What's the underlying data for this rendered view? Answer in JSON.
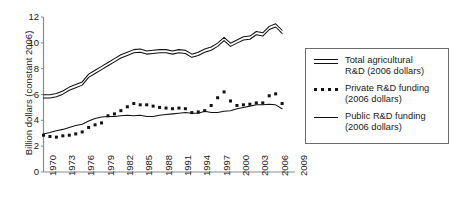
{
  "chart_data": {
    "type": "line",
    "title": "",
    "xlabel": "",
    "ylabel": "Billion dollars (constant 2006)",
    "xlim": [
      1970,
      2009
    ],
    "ylim": [
      0,
      12
    ],
    "yticks": [
      0,
      2,
      4,
      6,
      8,
      10,
      12
    ],
    "xticks": [
      "1970",
      "1973",
      "1976",
      "1979",
      "1982",
      "1985",
      "1988",
      "1991",
      "1994",
      "1997",
      "2000",
      "2003",
      "2006",
      "2009"
    ],
    "grid": false,
    "legend_position": "right",
    "x": [
      1970,
      1971,
      1972,
      1973,
      1974,
      1975,
      1976,
      1977,
      1978,
      1979,
      1980,
      1981,
      1982,
      1983,
      1984,
      1985,
      1986,
      1987,
      1988,
      1989,
      1990,
      1991,
      1992,
      1993,
      1994,
      1995,
      1996,
      1997,
      1998,
      1999,
      2000,
      2001,
      2002,
      2003,
      2004,
      2005,
      2006,
      2007
    ],
    "series": [
      {
        "name": "Total agricultural R&D (2006 dollars)",
        "style": "double-line",
        "values": [
          5.85,
          5.85,
          5.95,
          6.15,
          6.45,
          6.65,
          6.85,
          7.45,
          7.75,
          8.05,
          8.35,
          8.65,
          8.95,
          9.15,
          9.35,
          9.4,
          9.25,
          9.3,
          9.35,
          9.35,
          9.25,
          9.35,
          9.3,
          9.0,
          9.15,
          9.4,
          9.55,
          9.85,
          10.3,
          9.85,
          10.1,
          10.35,
          10.4,
          10.75,
          10.65,
          11.15,
          11.35,
          10.85
        ]
      },
      {
        "name": "Private R&D funding (2006 dollars)",
        "style": "dotted",
        "values": [
          2.85,
          2.75,
          2.7,
          2.8,
          2.85,
          2.95,
          3.1,
          3.45,
          3.65,
          3.8,
          4.35,
          4.5,
          4.75,
          5.05,
          5.3,
          5.2,
          5.2,
          5.1,
          5.0,
          4.95,
          4.9,
          4.95,
          4.9,
          4.6,
          4.65,
          4.75,
          5.15,
          5.75,
          6.2,
          5.5,
          5.15,
          5.2,
          5.25,
          5.35,
          5.35,
          5.9,
          6.05,
          5.3
        ]
      },
      {
        "name": "Public R&D funding (2006 dollars)",
        "style": "solid",
        "values": [
          2.95,
          3.05,
          3.2,
          3.3,
          3.45,
          3.6,
          3.7,
          3.95,
          4.15,
          4.25,
          4.3,
          4.3,
          4.35,
          4.4,
          4.35,
          4.4,
          4.3,
          4.3,
          4.4,
          4.45,
          4.5,
          4.55,
          4.6,
          4.55,
          4.55,
          4.7,
          4.6,
          4.6,
          4.7,
          4.75,
          4.9,
          5.0,
          5.1,
          5.2,
          5.2,
          5.25,
          5.2,
          4.9
        ]
      }
    ]
  },
  "legend": {
    "items": [
      {
        "key": "double-line-key",
        "label": "Total agricultural\nR&D (2006 dollars)"
      },
      {
        "key": "dotted-line-key",
        "label": "Private R&D funding\n(2006 dollars)"
      },
      {
        "key": "solid-line-key",
        "label": "Public R&D funding\n(2006 dollars)"
      }
    ]
  },
  "colors": {
    "line": "#111111",
    "axis": "#8a8a8a",
    "legend_border": "#6b6b6b",
    "background": "#ffffff"
  }
}
